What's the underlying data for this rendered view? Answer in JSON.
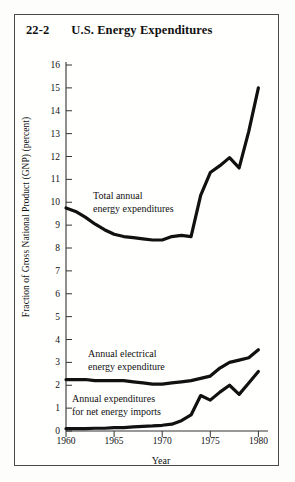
{
  "figure": {
    "number": "22-2",
    "title": "U.S. Energy Expenditures",
    "background_color": "#fdfdfb",
    "frame_color": "#4a4a4a",
    "line_color": "#111111"
  },
  "chart_data": {
    "type": "line",
    "title": "U.S. Energy Expenditures",
    "xlabel": "Year",
    "ylabel": "Fraction of Gross National Product (GNP) (percent)",
    "xlim": [
      1960,
      1981
    ],
    "ylim": [
      0,
      16
    ],
    "xticks": [
      1960,
      1965,
      1970,
      1975,
      1980
    ],
    "xtick_labels": [
      "1960",
      "1965",
      "1970",
      "1975",
      "1980"
    ],
    "yticks": [
      0,
      1,
      2,
      3,
      4,
      5,
      6,
      7,
      8,
      9,
      10,
      11,
      12,
      13,
      14,
      15,
      16
    ],
    "ytick_labels": [
      "0",
      "1",
      "2",
      "3",
      "4",
      "5",
      "6",
      "7",
      "8",
      "9",
      "10",
      "11",
      "12",
      "13",
      "14",
      "15",
      "16"
    ],
    "grid": false,
    "legend": "annotations",
    "x": [
      1960,
      1961,
      1962,
      1963,
      1964,
      1965,
      1966,
      1967,
      1968,
      1969,
      1970,
      1971,
      1972,
      1973,
      1974,
      1975,
      1976,
      1977,
      1978,
      1979,
      1980
    ],
    "series": [
      {
        "name": "Total annual energy expenditures",
        "annotation": "Total annual\nenergy expenditures",
        "values": [
          9.75,
          9.6,
          9.35,
          9.05,
          8.8,
          8.6,
          8.5,
          8.45,
          8.4,
          8.35,
          8.35,
          8.5,
          8.55,
          8.5,
          10.3,
          11.3,
          11.6,
          11.95,
          11.5,
          13.1,
          15.0
        ]
      },
      {
        "name": "Annual electrical energy expenditure",
        "annotation": "Annual electrical\nenergy expenditure",
        "values": [
          2.25,
          2.25,
          2.25,
          2.2,
          2.2,
          2.2,
          2.2,
          2.15,
          2.1,
          2.05,
          2.05,
          2.1,
          2.15,
          2.2,
          2.3,
          2.4,
          2.75,
          3.0,
          3.1,
          3.2,
          3.55
        ]
      },
      {
        "name": "Annual expenditures for net energy imports",
        "annotation": "Annual expenditures\nfor net energy imports",
        "values": [
          0.1,
          0.1,
          0.1,
          0.12,
          0.12,
          0.15,
          0.15,
          0.18,
          0.2,
          0.22,
          0.25,
          0.3,
          0.45,
          0.7,
          1.55,
          1.35,
          1.7,
          2.0,
          1.6,
          2.1,
          2.6
        ]
      }
    ]
  },
  "annotations": {
    "total": {
      "line1": "Total annual",
      "line2": "energy expenditures"
    },
    "electrical": {
      "line1": "Annual electrical",
      "line2": "energy expenditure"
    },
    "imports": {
      "line1": "Annual expenditures",
      "line2": "for net energy imports"
    }
  }
}
